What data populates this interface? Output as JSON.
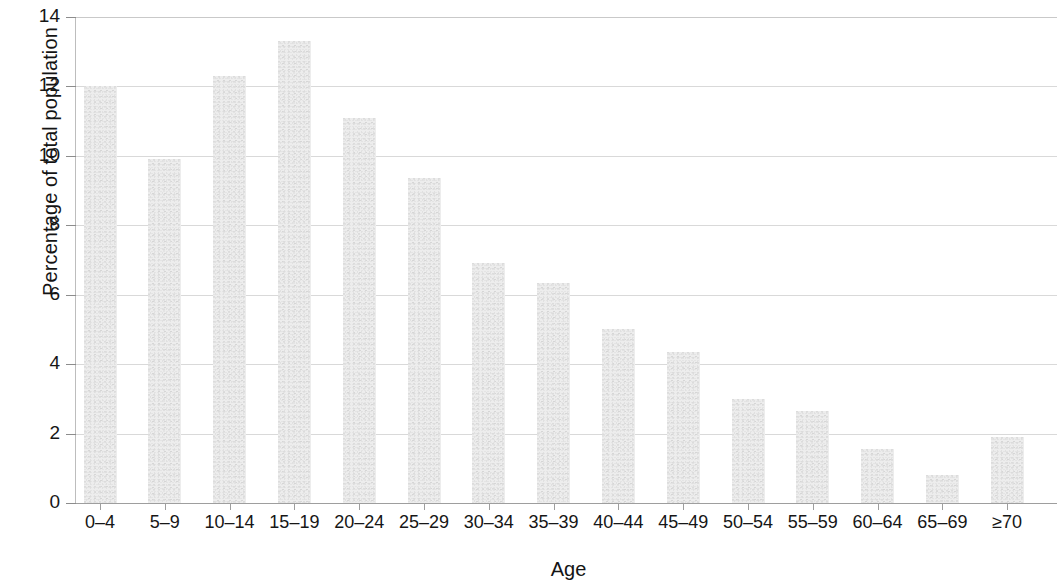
{
  "chart_data": {
    "type": "bar",
    "title": "",
    "xlabel": "Age",
    "ylabel": "Percentage of total population",
    "categories": [
      "0–4",
      "5–9",
      "10–14",
      "15–19",
      "20–24",
      "25–29",
      "30–34",
      "35–39",
      "40–44",
      "45–49",
      "50–54",
      "55–59",
      "60–64",
      "65–69",
      "≥70"
    ],
    "values": [
      12.0,
      9.9,
      12.3,
      13.3,
      11.1,
      9.35,
      6.9,
      6.35,
      5.0,
      4.35,
      3.0,
      2.65,
      1.55,
      0.8,
      1.9
    ],
    "ylim": [
      0,
      14
    ],
    "yticks": [
      0,
      2,
      4,
      6,
      8,
      10,
      12,
      14
    ],
    "ytick_labels": [
      "0",
      "2",
      "4",
      "6",
      "8",
      "10",
      "12",
      "14"
    ],
    "grid": "horizontal",
    "legend": "none",
    "bar_color": "#ededed",
    "grid_color": "#d9d9d9",
    "axis_color": "#9e9e9e",
    "text_color": "#161616"
  }
}
